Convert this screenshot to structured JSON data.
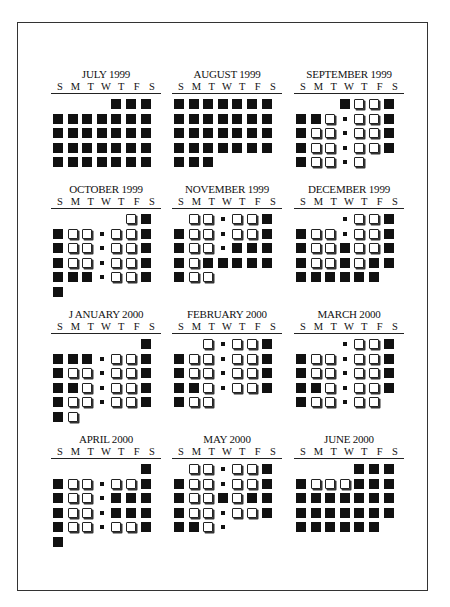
{
  "weekday_labels": [
    "S",
    "M",
    "T",
    "W",
    "T",
    "F",
    "S"
  ],
  "legend": {
    "B": "filled-square",
    "O": "open-square",
    "s": "small-dot",
    "": "no-day"
  },
  "months": [
    {
      "title": "JULY 1999",
      "start": 4,
      "days": "BBB BBBBBBB BBBBBBB BBBBBBB BBBBBBB"
    },
    {
      "title": "AUGUST 1999",
      "start": 0,
      "days": "BBBBBBB BBBBBBB BBBBBBB BBBBBBB BBB"
    },
    {
      "title": "SEPTEMBER 1999",
      "start": 3,
      "days": "BOOB BBOsOOB BOOsOOB BOOsOOB BOOsO"
    },
    {
      "title": "OCTOBER 1999",
      "start": 5,
      "days": "OB BOOsOOB BOOsOOB BOOsOOB BBBsOOB B"
    },
    {
      "title": "NOVEMBER 1999",
      "start": 1,
      "days": "OOsOOB BOOsOOB BOOsBBB BOBBBBB BOO"
    },
    {
      "title": "DECEMBER 1999",
      "start": 3,
      "days": "sOOB BOOsOOB BOOBOOB BOOBOBB BBBBBB"
    },
    {
      "title": "J ANUARY 2000",
      "start": 6,
      "days": "B BBBsOOB BOOsOOB BBOsOOB BOOsOOB BO"
    },
    {
      "title": "FEBRUARY 2000",
      "start": 2,
      "days": "OsOOB BOOsOOB BOOsOOB BBOsOOB BOO"
    },
    {
      "title": "MARCH 2000",
      "start": 3,
      "days": "sOOB BOOsOOB BOOsOOB BBOsOOB BOOsOO"
    },
    {
      "title": "APRIL 2000",
      "start": 6,
      "days": "B BOOsOOB BOOsBBB BOOsBBB BOOsOOB B"
    },
    {
      "title": "MAY 2000",
      "start": 1,
      "days": "OOsOOB BOOsOOB BOOBOBB BOOsOOB BBOs"
    },
    {
      "title": "JUNE 2000",
      "start": 4,
      "days": "BBB BOOOBBB BBBBBBB BBBBBBB BBBBBB"
    }
  ],
  "layout": {
    "columns_x": [
      51,
      172,
      294
    ],
    "rows_y": [
      68,
      183,
      308,
      433
    ]
  }
}
